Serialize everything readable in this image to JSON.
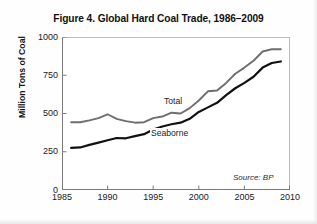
{
  "figure": {
    "title": "Figure 4. Global Hard Coal Trade, 1986–2009",
    "source_note": "Source: BP"
  },
  "colors": {
    "total_line": "#6e6e6e",
    "seaborne_line": "#111111",
    "axis": "#7a7a7a",
    "text": "#1a1a1a",
    "background": "#ffffff"
  },
  "chart_data": {
    "type": "line",
    "title": "Figure 4. Global Hard Coal Trade, 1986–2009",
    "xlabel": "",
    "ylabel": "Million Tons of Coal",
    "xlim": [
      1985,
      2010
    ],
    "ylim": [
      0,
      1000
    ],
    "xticks": [
      1985,
      1990,
      1995,
      2000,
      2005,
      2010
    ],
    "yticks": [
      0,
      250,
      500,
      750,
      1000
    ],
    "xtick_labels": [
      "1985",
      "1990",
      "1995",
      "2000",
      "2005",
      "2010"
    ],
    "ytick_labels": [
      "0",
      "250",
      "500",
      "750",
      "1000"
    ],
    "grid": false,
    "legend": "inline-labels",
    "annotations": [
      {
        "text": "Total",
        "x": 1997.0,
        "y": 600
      },
      {
        "text": "Seaborne",
        "x": 1995.6,
        "y": 390
      },
      {
        "text": "Source: BP",
        "x": 2008.2,
        "y": 45
      }
    ],
    "x": [
      1986,
      1987,
      1988,
      1989,
      1990,
      1991,
      1992,
      1993,
      1994,
      1995,
      1996,
      1997,
      1998,
      1999,
      2000,
      2001,
      2002,
      2003,
      2004,
      2005,
      2006,
      2007,
      2008,
      2009
    ],
    "series": [
      {
        "name": "Total",
        "color": "#6e6e6e",
        "values": [
          443,
          443,
          455,
          470,
          495,
          465,
          450,
          440,
          443,
          470,
          480,
          505,
          500,
          535,
          585,
          645,
          650,
          700,
          760,
          800,
          845,
          905,
          920,
          920
        ]
      },
      {
        "name": "Seaborne",
        "color": "#111111",
        "values": [
          275,
          278,
          295,
          310,
          325,
          340,
          338,
          352,
          365,
          395,
          415,
          430,
          440,
          465,
          510,
          540,
          570,
          620,
          665,
          700,
          740,
          800,
          830,
          840
        ]
      }
    ]
  }
}
